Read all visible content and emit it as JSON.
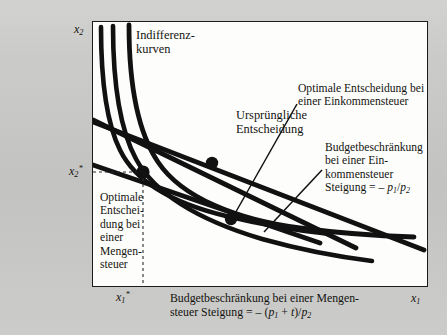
{
  "figure": {
    "type": "economics-diagram",
    "topic": "Mengensteuer versus Einkommensteuer",
    "axes": {
      "x_label": "x1",
      "y_label": "x2",
      "x_tick_label": "x1*",
      "y_tick_label": "x2*"
    },
    "annotations": {
      "indifference_curves": "Indifferenz-\nkurven",
      "original_choice": "Ursprüngliche\nEntscheidung",
      "optimum_income_tax": "Optimale Entscheidung bei\neiner Einkommensteuer",
      "budget_income_tax": "Budgetbeschränkung\nbei einer Ein-\nkommensteuer\nSteigung = – p1/p2",
      "optimum_quantity_tax": "Optimale\nEntschei-\ndung bei\neiner\nMengen-\nsteuer",
      "budget_quantity_tax": "Budgetbeschränkung bei einer Mengen-\nsteuer Steigung = – (p1 + t)/p2"
    },
    "slopes": {
      "income_tax": "– p1/p2",
      "quantity_tax": "– (p1 + t)/p2"
    },
    "points": [
      {
        "name": "Optimale Entscheidung bei einer Mengensteuer",
        "x": 143,
        "y": 172
      },
      {
        "name": "Ursprüngliche Entscheidung",
        "x": 212,
        "y": 163
      },
      {
        "name": "Optimale Entscheidung bei einer Einkommensteuer",
        "x": 231,
        "y": 219
      }
    ],
    "colors": {
      "page_background": "#c9c9c7",
      "plot_background": "#fdfdfc",
      "ink": "#14140f",
      "frame": "#1c1c1c"
    },
    "counts": {
      "indifference_curves": 3,
      "budget_lines": 2
    }
  }
}
